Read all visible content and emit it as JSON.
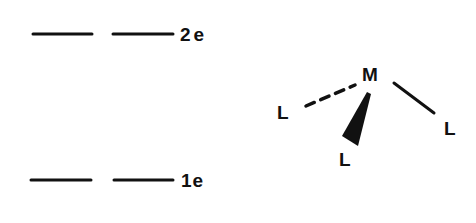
{
  "energy_levels": {
    "upper": {
      "label": "2e",
      "degeneracy": 2,
      "y": 34,
      "segments": [
        [
          33,
          92
        ],
        [
          113,
          173
        ]
      ],
      "label_x": 180
    },
    "lower": {
      "label": "1e",
      "degeneracy": 2,
      "y": 180,
      "segments": [
        [
          31,
          91
        ],
        [
          114,
          173
        ]
      ],
      "label_x": 181
    }
  },
  "molecule": {
    "center": {
      "label": "M",
      "x": 372,
      "y": 80
    },
    "ligands": [
      {
        "label": "L",
        "position": "left",
        "bond": "dashed",
        "x": 283,
        "y": 119
      },
      {
        "label": "L",
        "position": "right",
        "bond": "solid",
        "x": 450,
        "y": 135
      },
      {
        "label": "L",
        "position": "bottom",
        "bond": "wedge",
        "x": 345,
        "y": 166
      }
    ]
  },
  "colors": {
    "ink": "#111111",
    "background": "#ffffff"
  }
}
